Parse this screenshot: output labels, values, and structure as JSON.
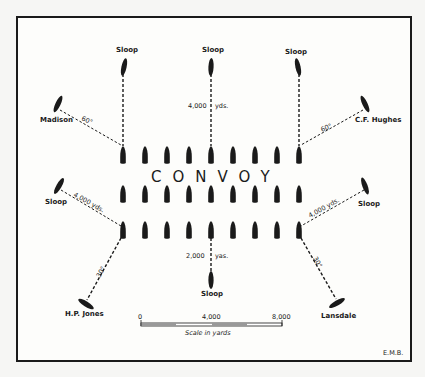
{
  "diagram": {
    "title": "CONVOY",
    "convoy_rows": 3,
    "ships_per_row": 9,
    "escorts": {
      "sloop_top_left": "Sloop",
      "sloop_top_center": "Sloop",
      "sloop_top_right": "Sloop",
      "madison": "Madison",
      "cf_hughes": "C.F. Hughes",
      "sloop_mid_left": "Sloop",
      "sloop_mid_right": "Sloop",
      "hp_jones": "H.P. Jones",
      "sloop_bottom_center": "Sloop",
      "lansdale": "Lansdale"
    },
    "distances": {
      "top_center": "4,000",
      "top_center_unit": "yds.",
      "bottom_center": "2,000",
      "bottom_center_unit": "yas.",
      "mid_left": "4,000 yds.",
      "mid_right": "4,000 yds."
    },
    "angles": {
      "madison": "60°",
      "cf_hughes": "60°",
      "hp_jones": "30°",
      "lansdale": "30°"
    },
    "scale": {
      "tick_0": "0",
      "tick_4000": "4,000",
      "tick_8000": "8,000",
      "caption": "Scale in yards"
    },
    "credit": "E.M.B."
  }
}
